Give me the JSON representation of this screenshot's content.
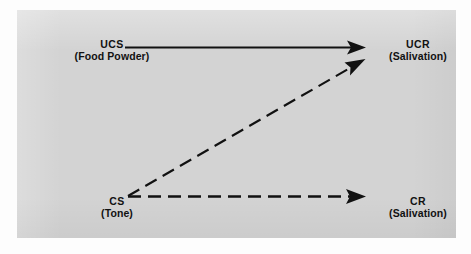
{
  "figure": {
    "panel_background": "#d3d3d3",
    "page_background": "#ffffff",
    "ink_color": "#111111"
  },
  "nodes": [
    {
      "id": "ucs",
      "abbr": "UCS",
      "desc": "(Food Powder)",
      "position": "top-left"
    },
    {
      "id": "ucr",
      "abbr": "UCR",
      "desc": "(Salivation)",
      "position": "top-right"
    },
    {
      "id": "cs",
      "abbr": "CS",
      "desc": "(Tone)",
      "position": "bottom-left"
    },
    {
      "id": "cr",
      "abbr": "CR",
      "desc": "(Salivation)",
      "position": "bottom-right"
    }
  ],
  "arrows": [
    {
      "id": "ucs-to-ucr",
      "from": "ucs",
      "to": "ucr",
      "style": "solid",
      "color": "#111111"
    },
    {
      "id": "cs-to-ucr",
      "from": "cs",
      "to": "ucr",
      "style": "dashed",
      "color": "#111111"
    },
    {
      "id": "cs-to-cr",
      "from": "cs",
      "to": "cr",
      "style": "dashed",
      "color": "#111111"
    }
  ]
}
